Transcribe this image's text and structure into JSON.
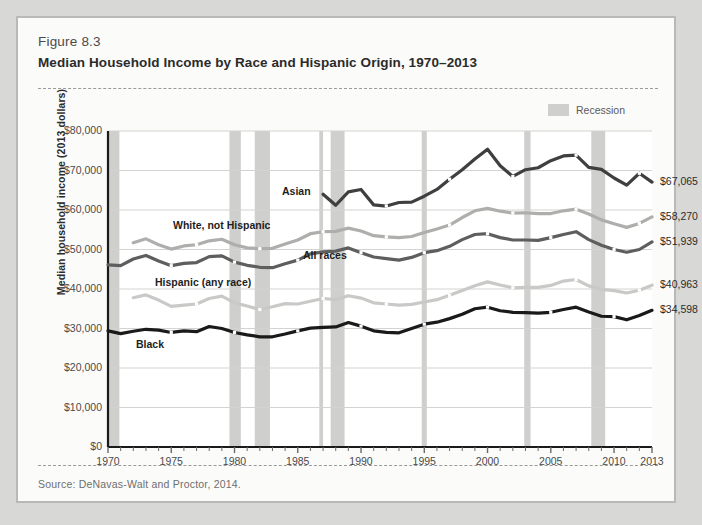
{
  "figure": {
    "number": "Figure 8.3",
    "title": "Median Household Income by Race and Hispanic Origin, 1970–2013",
    "source": "Source: DeNavas-Walt and Proctor, 2014."
  },
  "legend": {
    "recession_label": "Recession",
    "recession_color": "#cfcfcd"
  },
  "chart_data": {
    "type": "line",
    "title": "Median Household Income by Race and Hispanic Origin, 1970–2013",
    "xlabel": "",
    "ylabel": "Median household income (2013 dollars)",
    "xlim": [
      1970,
      2013
    ],
    "ylim": [
      0,
      80000
    ],
    "grid": true,
    "legend_position": "inline-labels",
    "y_ticks": [
      0,
      10000,
      20000,
      30000,
      40000,
      50000,
      60000,
      70000,
      80000
    ],
    "y_tick_labels": [
      "$0",
      "$10,000",
      "$20,000",
      "$30,000",
      "$40,000",
      "$50,000",
      "$60,000",
      "$70,000",
      "$80,000"
    ],
    "x_ticks": [
      1970,
      1975,
      1980,
      1985,
      1990,
      1995,
      2000,
      2005,
      2010,
      2013
    ],
    "x_tick_labels": [
      "1970",
      "1975",
      "1980",
      "1985",
      "1990",
      "1995",
      "2000",
      "2005",
      "2010",
      "2013"
    ],
    "recessions": [
      {
        "start": 1970.0,
        "end": 1970.9
      },
      {
        "start": 1979.6,
        "end": 1980.5
      },
      {
        "start": 1981.6,
        "end": 1982.8
      },
      {
        "start": 1986.7,
        "end": 1987.0
      },
      {
        "start": 1987.6,
        "end": 1988.7
      },
      {
        "start": 1994.8,
        "end": 1995.2
      },
      {
        "start": 2002.9,
        "end": 2003.4
      },
      {
        "start": 2008.2,
        "end": 2009.3
      }
    ],
    "series": [
      {
        "name": "Asian",
        "color": "#3f3f3f",
        "end_value_label": "$67,065",
        "end_value": 67065,
        "x": [
          1987,
          1988,
          1989,
          1990,
          1991,
          1992,
          1993,
          1994,
          1995,
          1996,
          1997,
          1998,
          1999,
          2000,
          2001,
          2002,
          2003,
          2004,
          2005,
          2006,
          2007,
          2008,
          2009,
          2010,
          2011,
          2012,
          2013
        ],
        "values": [
          64000,
          61200,
          64600,
          65200,
          61300,
          61000,
          61900,
          62000,
          63500,
          65200,
          67800,
          70200,
          72900,
          75400,
          71200,
          68500,
          70200,
          70700,
          72500,
          73700,
          73900,
          70800,
          70300,
          68100,
          66300,
          69300,
          67065
        ]
      },
      {
        "name": "White, not Hispanic",
        "color": "#aeaeac",
        "end_value_label": "$58,270",
        "end_value": 58270,
        "x": [
          1972,
          1973,
          1974,
          1975,
          1976,
          1977,
          1978,
          1979,
          1980,
          1981,
          1982,
          1983,
          1984,
          1985,
          1986,
          1987,
          1988,
          1989,
          1990,
          1991,
          1992,
          1993,
          1994,
          1995,
          1996,
          1997,
          1998,
          1999,
          2000,
          2001,
          2002,
          2003,
          2004,
          2005,
          2006,
          2007,
          2008,
          2009,
          2010,
          2011,
          2012,
          2013
        ],
        "values": [
          51700,
          52700,
          51200,
          50100,
          50900,
          51200,
          52200,
          52600,
          51200,
          50400,
          50200,
          50300,
          51400,
          52400,
          54000,
          54500,
          54600,
          55400,
          54700,
          53500,
          53200,
          53000,
          53300,
          54300,
          55200,
          56200,
          58100,
          59800,
          60400,
          59700,
          59200,
          59300,
          59100,
          59100,
          59800,
          60200,
          59000,
          57500,
          56500,
          55600,
          56600,
          58270
        ]
      },
      {
        "name": "All races",
        "color": "#5e5e5e",
        "end_value_label": "$51,939",
        "end_value": 51939,
        "x": [
          1970,
          1971,
          1972,
          1973,
          1974,
          1975,
          1976,
          1977,
          1978,
          1979,
          1980,
          1981,
          1982,
          1983,
          1984,
          1985,
          1986,
          1987,
          1988,
          1989,
          1990,
          1991,
          1992,
          1993,
          1994,
          1995,
          1996,
          1997,
          1998,
          1999,
          2000,
          2001,
          2002,
          2003,
          2004,
          2005,
          2006,
          2007,
          2008,
          2009,
          2010,
          2011,
          2012,
          2013
        ],
        "values": [
          46100,
          45900,
          47600,
          48500,
          47100,
          45900,
          46500,
          46700,
          48200,
          48400,
          46800,
          46000,
          45500,
          45400,
          46400,
          47300,
          48900,
          49400,
          49600,
          50400,
          49200,
          48100,
          47700,
          47300,
          48000,
          49200,
          49700,
          50800,
          52500,
          53800,
          54000,
          53000,
          52400,
          52400,
          52300,
          53000,
          53800,
          54500,
          52500,
          51100,
          50000,
          49300,
          50000,
          51939
        ]
      },
      {
        "name": "Hispanic (any race)",
        "color": "#c9c9c7",
        "end_value_label": "$40,963",
        "end_value": 40963,
        "x": [
          1972,
          1973,
          1974,
          1975,
          1976,
          1977,
          1978,
          1979,
          1980,
          1981,
          1982,
          1983,
          1984,
          1985,
          1986,
          1987,
          1988,
          1989,
          1990,
          1991,
          1992,
          1993,
          1994,
          1995,
          1996,
          1997,
          1998,
          1999,
          2000,
          2001,
          2002,
          2003,
          2004,
          2005,
          2006,
          2007,
          2008,
          2009,
          2010,
          2011,
          2012,
          2013
        ],
        "values": [
          37800,
          38500,
          37200,
          35600,
          35900,
          36200,
          37600,
          38200,
          36500,
          35700,
          34800,
          35500,
          36300,
          36200,
          36900,
          37600,
          37300,
          38300,
          37700,
          36500,
          36200,
          35900,
          36100,
          36700,
          37300,
          38400,
          39600,
          40800,
          41800,
          41000,
          40300,
          40400,
          40400,
          40900,
          42000,
          42400,
          40800,
          39900,
          39600,
          39000,
          39700,
          40963
        ]
      },
      {
        "name": "Black",
        "color": "#1a1a1a",
        "end_value_label": "$34,598",
        "end_value": 34598,
        "x": [
          1970,
          1971,
          1972,
          1973,
          1974,
          1975,
          1976,
          1977,
          1978,
          1979,
          1980,
          1981,
          1982,
          1983,
          1984,
          1985,
          1986,
          1987,
          1988,
          1989,
          1990,
          1991,
          1992,
          1993,
          1994,
          1995,
          1996,
          1997,
          1998,
          1999,
          2000,
          2001,
          2002,
          2003,
          2004,
          2005,
          2006,
          2007,
          2008,
          2009,
          2010,
          2011,
          2012,
          2013
        ],
        "values": [
          29400,
          28700,
          29300,
          29800,
          29600,
          29000,
          29400,
          29200,
          30500,
          30000,
          29000,
          28400,
          27900,
          27900,
          28600,
          29400,
          30100,
          30300,
          30400,
          31500,
          30600,
          29400,
          29000,
          28900,
          30000,
          31100,
          31600,
          32500,
          33600,
          35000,
          35400,
          34500,
          34100,
          34000,
          33900,
          34100,
          34800,
          35400,
          34200,
          33100,
          33000,
          32200,
          33300,
          34598
        ]
      }
    ]
  }
}
